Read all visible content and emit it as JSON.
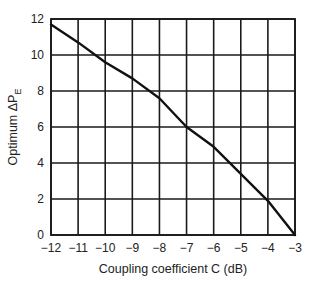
{
  "chart_data": {
    "type": "line",
    "title": "",
    "xlabel": "Coupling coefficient C (dB)",
    "ylabel": "Optimum ΔP",
    "ylabel_subscript": "E",
    "xlim": [
      -12,
      -3
    ],
    "ylim": [
      0,
      12
    ],
    "x_ticks": [
      -12,
      -11,
      -10,
      -9,
      -8,
      -7,
      -6,
      -5,
      -4,
      -3
    ],
    "x_tick_labels": [
      "−12",
      "−11",
      "−10",
      "−9",
      "−8",
      "−7",
      "−6",
      "−5",
      "−4",
      "−3"
    ],
    "y_ticks": [
      0,
      2,
      4,
      6,
      8,
      10,
      12
    ],
    "y_tick_labels": [
      "0",
      "2",
      "4",
      "6",
      "8",
      "10",
      "12"
    ],
    "grid": true,
    "legend": null,
    "series": [
      {
        "name": "Optimum ΔP_E",
        "color": "#111111",
        "x": [
          -12,
          -11,
          -10,
          -9,
          -8,
          -7,
          -6,
          -5,
          -4,
          -3
        ],
        "values": [
          11.7,
          10.7,
          9.6,
          8.7,
          7.6,
          6.0,
          4.9,
          3.4,
          1.9,
          0.0
        ]
      }
    ]
  }
}
